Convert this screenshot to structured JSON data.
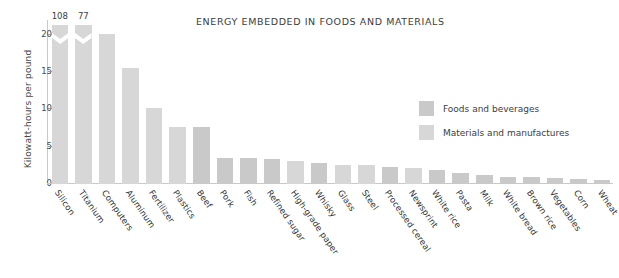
{
  "chart_data": {
    "type": "bar",
    "title": "ENERGY EMBEDDED IN FOODS AND MATERIALS",
    "xlabel": "",
    "ylabel": "Kilowatt-hours per pound",
    "ylim": [
      0,
      22
    ],
    "yticks": [
      0,
      5,
      10,
      15,
      20
    ],
    "ytick_labels": [
      "0",
      "5",
      "10",
      "15",
      "20"
    ],
    "grid": false,
    "legend_position": "center-right",
    "categories": [
      "Silicon",
      "Titanium",
      "Computers",
      "Aluminum",
      "Fertilizer",
      "Plastics",
      "Beef",
      "Pork",
      "Fish",
      "Refined sugar",
      "High-grade paper",
      "Whisky",
      "Glass",
      "Steel",
      "Processed cereal",
      "Newsprint",
      "White rice",
      "Pasta",
      "Milk",
      "White bread",
      "Brown rice",
      "Vegetables",
      "Corn",
      "Wheat"
    ],
    "values": [
      108,
      77,
      20.1,
      15.5,
      10.2,
      7.6,
      7.6,
      3.5,
      3.5,
      3.3,
      3.1,
      2.8,
      2.6,
      2.5,
      2.3,
      2.1,
      1.9,
      1.5,
      1.2,
      1.0,
      0.9,
      0.75,
      0.65,
      0.55
    ],
    "groups": [
      "materials",
      "materials",
      "materials",
      "materials",
      "materials",
      "materials",
      "foods",
      "foods",
      "foods",
      "foods",
      "materials",
      "foods",
      "materials",
      "materials",
      "foods",
      "materials",
      "foods",
      "foods",
      "foods",
      "foods",
      "foods",
      "foods",
      "foods",
      "foods"
    ],
    "truncated": [
      true,
      true,
      false,
      false,
      false,
      false,
      false,
      false,
      false,
      false,
      false,
      false,
      false,
      false,
      false,
      false,
      false,
      false,
      false,
      false,
      false,
      false,
      false,
      false
    ],
    "value_labels": [
      "108",
      "77",
      "",
      "",
      "",
      "",
      "",
      "",
      "",
      "",
      "",
      "",
      "",
      "",
      "",
      "",
      "",
      "",
      "",
      "",
      "",
      "",
      "",
      ""
    ],
    "series": [
      {
        "name": "Foods and beverages",
        "color": "#c9c9c9"
      },
      {
        "name": "Materials and manufactures",
        "color": "#d7d7d7"
      }
    ]
  },
  "legend": {
    "items": [
      {
        "label": "Foods and beverages",
        "group": "foods"
      },
      {
        "label": "Materials and manufactures",
        "group": "materials"
      }
    ]
  },
  "colors": {
    "foods": "#c9c9c9",
    "materials": "#d7d7d7",
    "axis": "#c9c9c9",
    "text": "#3d3d3d",
    "background": "#ffffff"
  }
}
